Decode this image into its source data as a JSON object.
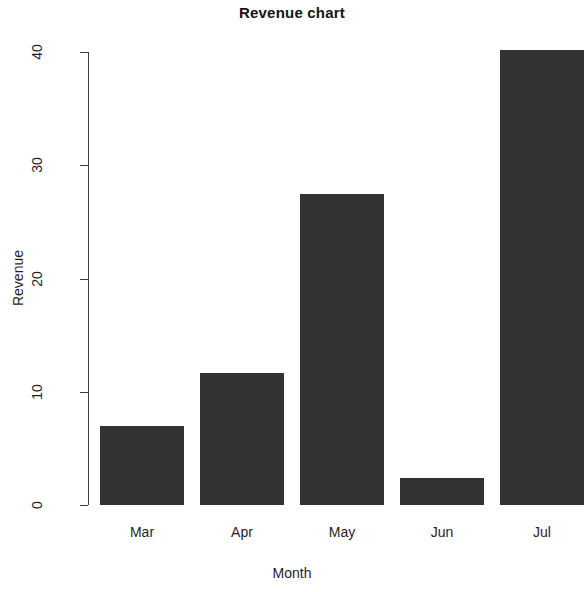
{
  "chart_data": {
    "type": "bar",
    "title": "Revenue chart",
    "xlabel": "Month",
    "ylabel": "Revenue",
    "categories": [
      "Mar",
      "Apr",
      "May",
      "Jun",
      "Jul"
    ],
    "values": [
      7.0,
      11.7,
      27.5,
      2.4,
      40.2
    ],
    "ylim": [
      0,
      40
    ],
    "yticks": [
      0,
      10,
      20,
      30,
      40
    ],
    "ytick_labels": [
      "0",
      "10",
      "20",
      "30",
      "40"
    ],
    "grid": false,
    "legend": null,
    "bar_color": "#333333",
    "axis_color": "#3a3a3a",
    "background": "#ffffff",
    "tick_label_rotation": -90
  }
}
